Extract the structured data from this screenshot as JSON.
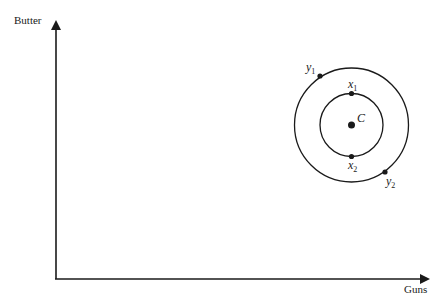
{
  "diagram": {
    "axes": {
      "y_label": "Butter",
      "x_label": "Guns"
    },
    "center": {
      "label": "C"
    },
    "points": [
      {
        "name": "x",
        "sub": "1"
      },
      {
        "name": "x",
        "sub": "2"
      },
      {
        "name": "y",
        "sub": "1"
      },
      {
        "name": "y",
        "sub": "2"
      }
    ],
    "colors": {
      "ink": "#1a1a1a",
      "background": "#ffffff"
    }
  }
}
